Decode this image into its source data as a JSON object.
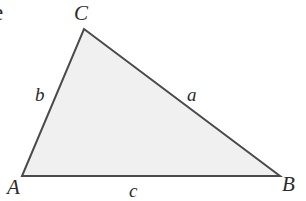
{
  "figure": {
    "type": "geometry-diagram",
    "shape": "triangle",
    "background_color": "#ffffff",
    "fill_color": "#f0f0f0",
    "stroke_color": "#4a4a4a",
    "stroke_width": 2,
    "label_color": "#2b2b2b",
    "stray_glyph": "e",
    "vertices": [
      {
        "name": "C",
        "label": "C",
        "x": 84,
        "y": 29
      },
      {
        "name": "A",
        "label": "A",
        "x": 22,
        "y": 176
      },
      {
        "name": "B",
        "label": "B",
        "x": 280,
        "y": 176
      }
    ],
    "sides": [
      {
        "name": "a",
        "label": "a",
        "between": "C-B"
      },
      {
        "name": "b",
        "label": "b",
        "between": "A-C"
      },
      {
        "name": "c",
        "label": "c",
        "between": "A-B"
      }
    ],
    "polygon_points": "84,29 280,176 22,176"
  }
}
